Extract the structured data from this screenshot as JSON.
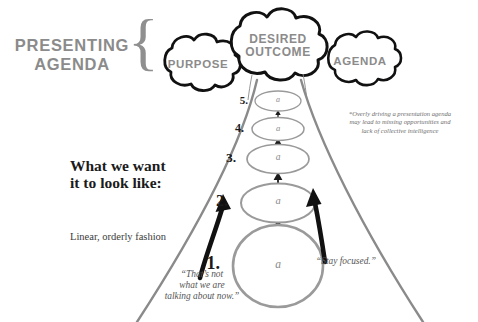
{
  "diagram": {
    "side_label": {
      "text": "PRESENTING\nAGENDA",
      "color": "#8b8b8b"
    },
    "brace": {
      "glyph": "{",
      "color": "#8f8f8f"
    },
    "clouds": [
      {
        "id": "purpose",
        "label": "PURPOSE",
        "cx": 198,
        "cy": 64,
        "rx": 38,
        "ry": 26
      },
      {
        "id": "desired-outcome",
        "label": "DESIRED\nOUTCOME",
        "cx": 278,
        "cy": 45,
        "rx": 48,
        "ry": 32
      },
      {
        "id": "agenda",
        "label": "AGENDA",
        "cx": 360,
        "cy": 62,
        "rx": 38,
        "ry": 26
      }
    ],
    "headline": {
      "title": "What we want\nit to look like:",
      "subtitle": "Linear, orderly fashion"
    },
    "footnote": {
      "text": "*Overly driving a presentation agenda\nmay lead to missing opportunities and\nlack of collective intelligence"
    },
    "quotes": [
      {
        "id": "left",
        "text": "“That’s not\nwhat we are\ntalking about now.”"
      },
      {
        "id": "right",
        "text": "“Stay focused.”"
      }
    ],
    "steps": [
      {
        "number": "5.",
        "letter": "a",
        "cx": 278,
        "cy": 101,
        "rx": 23,
        "ry": 10,
        "num_size": 11,
        "letter_size": 8
      },
      {
        "number": "4.",
        "letter": "a",
        "cx": 278,
        "cy": 129,
        "rx": 26,
        "ry": 11,
        "num_size": 12,
        "letter_size": 8.5
      },
      {
        "number": "3.",
        "letter": "a",
        "cx": 278,
        "cy": 159,
        "rx": 31,
        "ry": 14,
        "num_size": 13.5,
        "letter_size": 9
      },
      {
        "number": "2.",
        "letter": "a",
        "cx": 278,
        "cy": 203,
        "rx": 37,
        "ry": 19,
        "num_size": 15.5,
        "letter_size": 10
      },
      {
        "number": "1.",
        "letter": "a",
        "cx": 278,
        "cy": 265,
        "rx": 45,
        "ry": 40,
        "num_size": 18,
        "letter_size": 11
      }
    ],
    "funnel": {
      "color": "#8a8a8a",
      "left_top_x": 256,
      "right_top_x": 300,
      "top_y": 80,
      "left_bottom_x": 139,
      "right_bottom_x": 420,
      "bottom_y": 322
    },
    "colors": {
      "background": "#ffffff",
      "ink": "#1b1b1b",
      "gray_line": "#8a8a8a",
      "gray_text": "#8b8b8b"
    }
  }
}
